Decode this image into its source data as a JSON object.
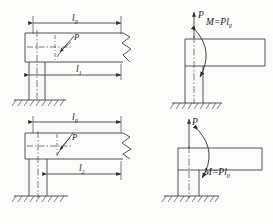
{
  "figure": {
    "stroke_color": "#2b2b2b",
    "background": "#fbfbfa",
    "panels": [
      {
        "id": "top-left",
        "name": "original-loading-case-1",
        "labels": {
          "dim_top": "l",
          "dim_top_sub": "0",
          "dim_bottom": "l",
          "dim_bottom_sub": "1",
          "force": "P"
        }
      },
      {
        "id": "top-right",
        "name": "equivalent-loading-case-1",
        "labels": {
          "force": "P",
          "moment": "M=Pl",
          "moment_sub": "0"
        }
      },
      {
        "id": "bottom-left",
        "name": "original-loading-case-2",
        "labels": {
          "dim_top": "l",
          "dim_top_sub": "0",
          "dim_bottom": "l",
          "dim_bottom_sub": "2",
          "force": "P"
        }
      },
      {
        "id": "bottom-right",
        "name": "equivalent-loading-case-2",
        "labels": {
          "force": "P",
          "moment": "M=Pl",
          "moment_sub": "0"
        }
      }
    ]
  }
}
